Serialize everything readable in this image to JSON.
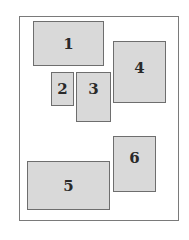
{
  "diagram": {
    "boxes": [
      {
        "label": "1"
      },
      {
        "label": "2"
      },
      {
        "label": "3"
      },
      {
        "label": "4"
      },
      {
        "label": "5"
      },
      {
        "label": "6"
      }
    ]
  }
}
